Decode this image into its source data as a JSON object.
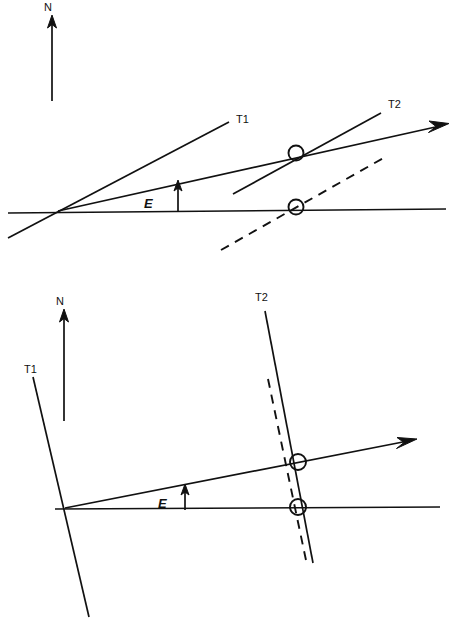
{
  "figure": {
    "background_color": "#ffffff",
    "line_color": "#111111",
    "panels": [
      {
        "name": "upper-panel",
        "north_arrow": {
          "label": "N",
          "tail": [
            52,
            101
          ],
          "tip": [
            52,
            18
          ]
        },
        "elevation_arrow": {
          "label": "E",
          "label_pos": [
            144,
            204
          ],
          "tail": [
            178,
            212
          ],
          "tip": [
            178,
            182
          ]
        },
        "horizon_line": {
          "name": "horizon",
          "from": [
            58,
            211
          ],
          "to": [
            446,
            209
          ]
        },
        "track_lines": [
          {
            "label": "T1",
            "label_pos": [
              236,
              122
            ],
            "from": [
              8,
              237
            ],
            "to": [
              228,
              122
            ],
            "style": "solid"
          },
          {
            "label": "T2",
            "label_pos": [
              388,
              107
            ],
            "from": [
              233,
              193
            ],
            "to": [
              381,
              113
            ],
            "style": "solid"
          }
        ],
        "pointing_line": {
          "from": [
            58,
            211
          ],
          "to": [
            447,
            124
          ],
          "arrow": true
        },
        "dashed_line": {
          "from": [
            222,
            249
          ],
          "to": [
            386,
            157
          ],
          "style": "dashed"
        },
        "intersection_markers": [
          {
            "center": [
              296,
              153
            ],
            "radius": 7.5
          },
          {
            "center": [
              296,
              207
            ],
            "radius": 7.5
          }
        ]
      },
      {
        "name": "lower-panel",
        "north_arrow": {
          "label": "N",
          "tail": [
            64,
            421
          ],
          "tip": [
            64,
            312
          ]
        },
        "elevation_arrow": {
          "label": "E",
          "label_pos": [
            161,
            504
          ],
          "tail": [
            185,
            509
          ],
          "tip": [
            185,
            486
          ]
        },
        "horizon_line": {
          "name": "horizon",
          "from": [
            65,
            508
          ],
          "to": [
            440,
            507
          ]
        },
        "track_lines": [
          {
            "label": "T1",
            "label_pos": [
              27,
              372
            ],
            "from": [
              33,
              376
            ],
            "to": [
              88,
              616
            ],
            "style": "solid"
          },
          {
            "label": "T2",
            "label_pos": [
              258,
              300
            ],
            "from": [
              265,
              310
            ],
            "to": [
              313,
              563
            ],
            "style": "solid"
          }
        ],
        "pointing_line": {
          "from": [
            65,
            508
          ],
          "to": [
            414,
            440
          ],
          "arrow": true
        },
        "dashed_line": {
          "from": [
            268,
            380
          ],
          "to": [
            307,
            564
          ],
          "style": "dashed"
        },
        "intersection_markers": [
          {
            "center": [
              298,
              462
            ],
            "radius": 8.0
          },
          {
            "center": [
              298,
              507
            ],
            "radius": 8.0
          }
        ]
      }
    ]
  },
  "labels": {
    "north_upper": "N",
    "north_lower": "N",
    "elevation_upper": "E",
    "elevation_lower": "E",
    "t1_upper": "T1",
    "t2_upper": "T2",
    "t1_lower": "T1",
    "t2_lower": "T2"
  }
}
